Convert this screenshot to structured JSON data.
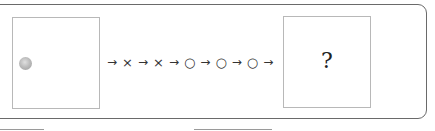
{
  "puzzle": {
    "start_box": {
      "content": "gray-ball"
    },
    "sequence": [
      {
        "type": "arrow",
        "text": "→"
      },
      {
        "type": "symbol",
        "text": "×"
      },
      {
        "type": "arrow",
        "text": "→"
      },
      {
        "type": "symbol",
        "text": "×"
      },
      {
        "type": "arrow",
        "text": "→"
      },
      {
        "type": "symbol",
        "text": "○"
      },
      {
        "type": "arrow",
        "text": "→"
      },
      {
        "type": "symbol",
        "text": "○"
      },
      {
        "type": "arrow",
        "text": "→"
      },
      {
        "type": "symbol",
        "text": "○"
      },
      {
        "type": "arrow",
        "text": "→"
      }
    ],
    "result_box": {
      "text": "?"
    }
  },
  "colors": {
    "frame": "#6a6a6a",
    "box_border": "#b8b8b8",
    "ball": "#bdbdbd"
  }
}
